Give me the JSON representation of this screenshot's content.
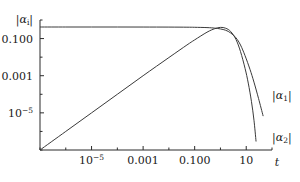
{
  "chart_data": {
    "type": "line",
    "title": "",
    "xlabel": "t",
    "ylabel": "|αᵢ|",
    "xscale": "log",
    "yscale": "log",
    "grid": false,
    "legend_position": "right-inline",
    "xlim": [
      1e-07,
      100
    ],
    "ylim": [
      1e-07,
      1.0
    ],
    "xticks": [
      {
        "value": 1e-05,
        "label_mantissa": "10",
        "label_exponent": "−5",
        "x_px": 76
      },
      {
        "value": 0.001,
        "label_mantissa": "0.001",
        "label_exponent": "",
        "x_px": 127
      },
      {
        "value": 0.1,
        "label_mantissa": "0.100",
        "label_exponent": "",
        "x_px": 178
      },
      {
        "value": 10,
        "label_mantissa": "10",
        "label_exponent": "",
        "x_px": 228
      }
    ],
    "yticks": [
      {
        "value": 0.1,
        "label_mantissa": "0.100",
        "label_exponent": "",
        "y_px": 35
      },
      {
        "value": 0.001,
        "label_mantissa": "0.001",
        "label_exponent": "",
        "y_px": 75
      },
      {
        "value": 1e-05,
        "label_mantissa": "10",
        "label_exponent": "−5",
        "y_px": 116
      }
    ],
    "series": [
      {
        "name": "|α₁|",
        "label": "|α₁|",
        "color": "#3a3a3a",
        "label_x_px": 272,
        "label_y_px": 99,
        "points": [
          [
            1e-07,
            0.42
          ],
          [
            1e-06,
            0.42
          ],
          [
            1e-05,
            0.42
          ],
          [
            0.0001,
            0.42
          ],
          [
            0.001,
            0.418
          ],
          [
            0.01,
            0.415
          ],
          [
            0.05,
            0.41
          ],
          [
            0.1,
            0.405
          ],
          [
            0.3,
            0.39
          ],
          [
            0.6,
            0.365
          ],
          [
            1.0,
            0.33
          ],
          [
            1.6,
            0.28
          ],
          [
            2.5,
            0.2
          ],
          [
            4.0,
            0.11
          ],
          [
            6.0,
            0.045
          ],
          [
            9.0,
            0.012
          ],
          [
            14.0,
            0.0022
          ],
          [
            20.0,
            0.00045
          ],
          [
            30.0,
            6e-05
          ],
          [
            45.0,
            7e-06
          ]
        ]
      },
      {
        "name": "|α₂|",
        "label": "|α₂|",
        "color": "#3a3a3a",
        "label_x_px": 272,
        "label_y_px": 141,
        "points": [
          [
            1e-07,
            1e-07
          ],
          [
            1e-06,
            1e-06
          ],
          [
            1e-05,
            1e-05
          ],
          [
            0.0001,
            0.0001
          ],
          [
            0.001,
            0.001
          ],
          [
            0.01,
            0.0095
          ],
          [
            0.05,
            0.045
          ],
          [
            0.1,
            0.085
          ],
          [
            0.3,
            0.22
          ],
          [
            0.6,
            0.34
          ],
          [
            1.0,
            0.4
          ],
          [
            1.6,
            0.36
          ],
          [
            2.5,
            0.24
          ],
          [
            4.0,
            0.09
          ],
          [
            6.0,
            0.02
          ],
          [
            9.0,
            0.0025
          ],
          [
            12.0,
            0.0004
          ],
          [
            16.0,
            4e-05
          ],
          [
            20.0,
            4e-06
          ],
          [
            24.0,
            3e-07
          ]
        ]
      }
    ]
  },
  "axes": {
    "x_axis_label": "t",
    "y_axis_label_mantissa": "|α",
    "y_axis_label_sub": "i",
    "y_axis_label_tail": "|"
  }
}
